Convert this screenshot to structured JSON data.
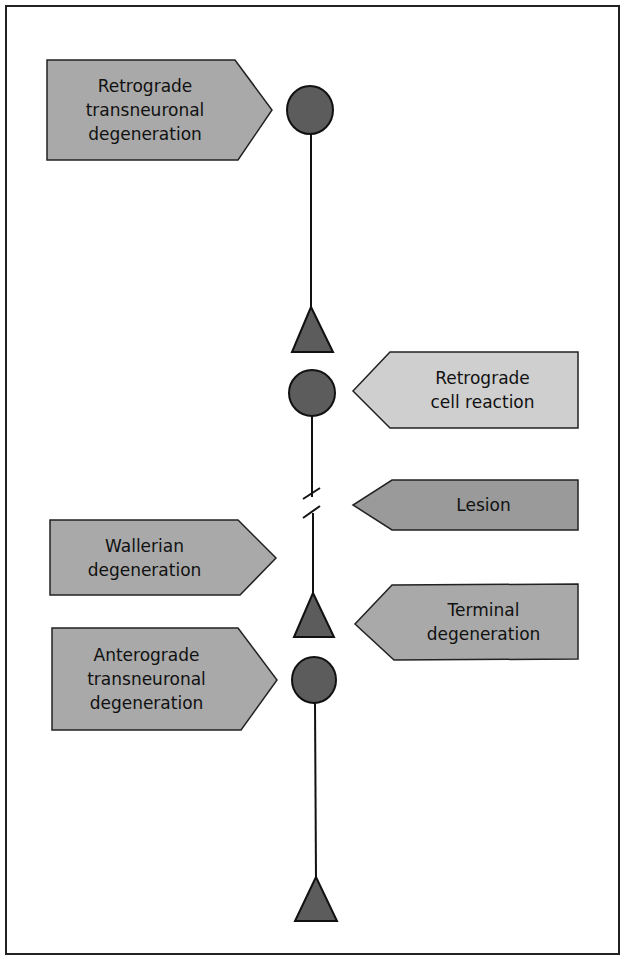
{
  "diagram": {
    "type": "neuronal degeneration schematic",
    "labels": {
      "retrograde_transneuronal": "Retrograde\ntransneuronal\ndegeneration",
      "retrograde_cell_reaction": "Retrograde\ncell reaction",
      "lesion": "Lesion",
      "wallerian": "Wallerian\ndegeneration",
      "terminal": "Terminal\ndegeneration",
      "anterograde_transneuronal": "Anterograde\ntransneuronal\ndegeneration"
    },
    "colors": {
      "cell_body": "#5c5c5c",
      "terminal": "#5c5c5c",
      "dark_label": "#a9a9a9",
      "light_label": "#cfcfcf",
      "lesion_label": "#9a9a9a",
      "outline": "#222222"
    }
  }
}
